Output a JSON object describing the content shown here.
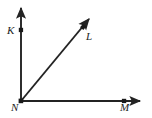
{
  "figure": {
    "type": "geometry-diagram",
    "background_color": "#ffffff",
    "stroke_color": "#232323",
    "point_color": "#1a1a1a",
    "labels": {
      "k": "K",
      "l": "L",
      "n": "N",
      "m": "M"
    },
    "points": [
      {
        "name": "K",
        "label": "K",
        "x": 21,
        "y": 30
      },
      {
        "name": "L",
        "label": "L",
        "x": 83,
        "y": 27
      },
      {
        "name": "N",
        "label": "N",
        "x": 21,
        "y": 101
      },
      {
        "name": "M",
        "label": "M",
        "x": 124,
        "y": 101
      }
    ],
    "rays": [
      {
        "name": "ray-NK",
        "from": "N",
        "through": "K",
        "x1": 21,
        "y1": 101,
        "x2": 21,
        "y2": 6,
        "arrow": true
      },
      {
        "name": "ray-NL",
        "from": "N",
        "through": "L",
        "x1": 21,
        "y1": 101,
        "x2": 91,
        "y2": 17,
        "arrow": true
      },
      {
        "name": "ray-NM",
        "from": "N",
        "through": "M",
        "x1": 21,
        "y1": 101,
        "x2": 142,
        "y2": 101,
        "arrow": true
      }
    ]
  }
}
